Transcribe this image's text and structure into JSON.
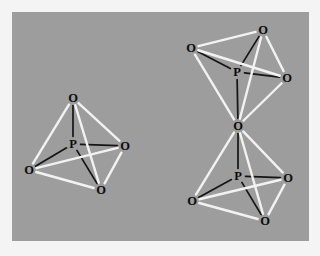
{
  "figure": {
    "kind": "crystal-structure-diagram",
    "background_color": "#9d9d9d",
    "border_color": "#f4f4f4",
    "front_bond_color": "#f2f2f2",
    "back_bond_color": "#141414",
    "label_color": "#0b0b0b",
    "panel": {
      "x": 12,
      "y": 12,
      "width": 297,
      "height": 229
    }
  },
  "chart_data": {
    "type": "scatter",
    "title": "",
    "xlabel": "",
    "ylabel": "",
    "xlim": [
      0,
      297
    ],
    "ylim": [
      0,
      229
    ],
    "grid": false,
    "legend": "none",
    "annotations": [
      "Isolated PO4 tetrahedron (left)",
      "Corner-sharing PO4 tetrahedra pair (right)"
    ],
    "nodes": [
      {
        "id": "L_O_top",
        "label": "O",
        "x": 61,
        "y": 86,
        "group": "left-tetrahedron"
      },
      {
        "id": "L_P",
        "label": "P",
        "x": 61,
        "y": 132,
        "group": "left-tetrahedron"
      },
      {
        "id": "L_O_right",
        "label": "O",
        "x": 113,
        "y": 134,
        "group": "left-tetrahedron"
      },
      {
        "id": "L_O_left",
        "label": "O",
        "x": 17,
        "y": 158,
        "group": "left-tetrahedron"
      },
      {
        "id": "L_O_bottom",
        "label": "O",
        "x": 89,
        "y": 178,
        "group": "left-tetrahedron"
      },
      {
        "id": "U_O_top",
        "label": "O",
        "x": 251,
        "y": 18,
        "group": "upper-tetrahedron"
      },
      {
        "id": "U_O_left",
        "label": "O",
        "x": 179,
        "y": 36,
        "group": "upper-tetrahedron"
      },
      {
        "id": "U_P",
        "label": "P",
        "x": 225,
        "y": 60,
        "group": "upper-tetrahedron"
      },
      {
        "id": "U_O_right",
        "label": "O",
        "x": 275,
        "y": 66,
        "group": "upper-tetrahedron"
      },
      {
        "id": "BR_O",
        "label": "O",
        "x": 226,
        "y": 114,
        "group": "bridging-oxygen"
      },
      {
        "id": "D_P",
        "label": "P",
        "x": 226,
        "y": 164,
        "group": "lower-tetrahedron"
      },
      {
        "id": "D_O_right",
        "label": "O",
        "x": 276,
        "y": 166,
        "group": "lower-tetrahedron"
      },
      {
        "id": "D_O_left",
        "label": "O",
        "x": 180,
        "y": 189,
        "group": "lower-tetrahedron"
      },
      {
        "id": "D_O_bottom",
        "label": "O",
        "x": 253,
        "y": 209,
        "group": "lower-tetrahedron"
      }
    ],
    "edges": [
      {
        "from": "L_O_top",
        "to": "L_P",
        "style": "back"
      },
      {
        "from": "L_O_top",
        "to": "L_O_left",
        "style": "front"
      },
      {
        "from": "L_O_top",
        "to": "L_O_right",
        "style": "front"
      },
      {
        "from": "L_O_top",
        "to": "L_O_bottom",
        "style": "front"
      },
      {
        "from": "L_P",
        "to": "L_O_left",
        "style": "back"
      },
      {
        "from": "L_P",
        "to": "L_O_right",
        "style": "back"
      },
      {
        "from": "L_P",
        "to": "L_O_bottom",
        "style": "back"
      },
      {
        "from": "L_O_left",
        "to": "L_O_right",
        "style": "front"
      },
      {
        "from": "L_O_left",
        "to": "L_O_bottom",
        "style": "front"
      },
      {
        "from": "L_O_right",
        "to": "L_O_bottom",
        "style": "front"
      },
      {
        "from": "U_O_top",
        "to": "U_P",
        "style": "back"
      },
      {
        "from": "U_O_top",
        "to": "U_O_left",
        "style": "front"
      },
      {
        "from": "U_O_top",
        "to": "U_O_right",
        "style": "front"
      },
      {
        "from": "U_O_top",
        "to": "BR_O",
        "style": "front"
      },
      {
        "from": "U_P",
        "to": "U_O_left",
        "style": "back"
      },
      {
        "from": "U_P",
        "to": "U_O_right",
        "style": "back"
      },
      {
        "from": "U_P",
        "to": "BR_O",
        "style": "back"
      },
      {
        "from": "U_O_left",
        "to": "U_O_right",
        "style": "front"
      },
      {
        "from": "U_O_left",
        "to": "BR_O",
        "style": "front"
      },
      {
        "from": "U_O_right",
        "to": "BR_O",
        "style": "front"
      },
      {
        "from": "BR_O",
        "to": "D_P",
        "style": "back"
      },
      {
        "from": "BR_O",
        "to": "D_O_left",
        "style": "front"
      },
      {
        "from": "BR_O",
        "to": "D_O_right",
        "style": "front"
      },
      {
        "from": "BR_O",
        "to": "D_O_bottom",
        "style": "front"
      },
      {
        "from": "D_P",
        "to": "D_O_left",
        "style": "back"
      },
      {
        "from": "D_P",
        "to": "D_O_right",
        "style": "back"
      },
      {
        "from": "D_P",
        "to": "D_O_bottom",
        "style": "back"
      },
      {
        "from": "D_O_left",
        "to": "D_O_right",
        "style": "front"
      },
      {
        "from": "D_O_left",
        "to": "D_O_bottom",
        "style": "front"
      },
      {
        "from": "D_O_right",
        "to": "D_O_bottom",
        "style": "front"
      }
    ]
  }
}
